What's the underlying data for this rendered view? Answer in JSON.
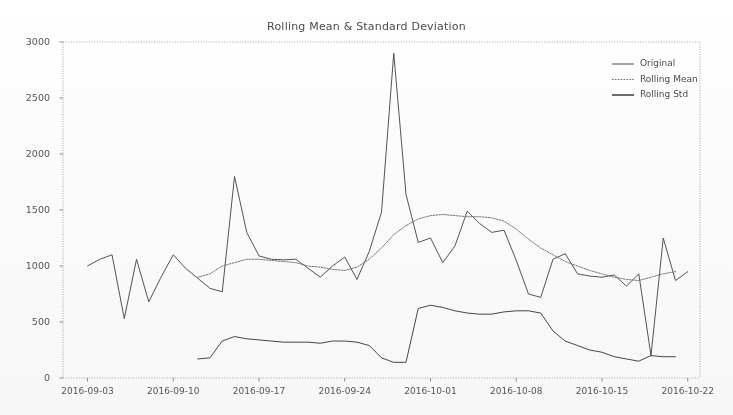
{
  "chart_data": {
    "type": "line",
    "title": "Rolling Mean & Standard Deviation",
    "xlabel": "",
    "ylabel": "",
    "ylim": [
      0,
      3000
    ],
    "yticks": [
      0,
      500,
      1000,
      1500,
      2000,
      2500,
      3000
    ],
    "ytick_labels": [
      "0",
      "500",
      "1000",
      "1500",
      "2000",
      "2500",
      "3000"
    ],
    "xticks": [
      "2016-09-03",
      "2016-09-10",
      "2016-09-17",
      "2016-09-24",
      "2016-10-01",
      "2016-10-08",
      "2016-10-15",
      "2016-10-22"
    ],
    "xtick_positions": [
      0.0385,
      0.1731,
      0.3077,
      0.4423,
      0.5769,
      0.7115,
      0.8462,
      0.9808
    ],
    "grid": false,
    "legend_position": "upper right",
    "legend": [
      {
        "name": "Original",
        "color": "#4a4a4a",
        "style": "solid"
      },
      {
        "name": "Rolling Mean",
        "color": "#6e6e6e",
        "style": "dotted"
      },
      {
        "name": "Rolling Std",
        "color": "#3c3c3c",
        "style": "solid"
      }
    ],
    "series": [
      {
        "name": "Original",
        "color": "#4a4a4a",
        "x_start": 0.0385,
        "x_step": 0.01923,
        "values": [
          1000,
          1060,
          1100,
          530,
          1060,
          680,
          900,
          1100,
          980,
          890,
          800,
          770,
          1800,
          1300,
          1090,
          1060,
          1055,
          1060,
          980,
          900,
          1000,
          1080,
          880,
          1130,
          1480,
          2900,
          1640,
          1210,
          1250,
          1030,
          1180,
          1490,
          1380,
          1300,
          1320,
          1050,
          750,
          720,
          1060,
          1110,
          930,
          910,
          900,
          920,
          820,
          930,
          200,
          1250,
          870,
          950
        ]
      },
      {
        "name": "Rolling Mean",
        "color": "#6e6e6e",
        "x_start": 0.2115,
        "x_step": 0.01923,
        "values": [
          900,
          930,
          1000,
          1030,
          1060,
          1060,
          1050,
          1040,
          1030,
          1000,
          990,
          970,
          960,
          990,
          1060,
          1160,
          1280,
          1360,
          1420,
          1450,
          1460,
          1450,
          1440,
          1440,
          1430,
          1400,
          1330,
          1240,
          1160,
          1100,
          1040,
          1000,
          960,
          930,
          900,
          880,
          870,
          900,
          930,
          950
        ]
      },
      {
        "name": "Rolling Std",
        "color": "#3c3c3c",
        "x_start": 0.2115,
        "x_step": 0.01923,
        "values": [
          170,
          180,
          330,
          370,
          350,
          340,
          330,
          320,
          320,
          320,
          310,
          330,
          330,
          320,
          290,
          180,
          140,
          140,
          620,
          650,
          630,
          600,
          580,
          570,
          570,
          590,
          600,
          600,
          580,
          420,
          330,
          290,
          250,
          230,
          190,
          170,
          150,
          200,
          190,
          190
        ]
      }
    ]
  },
  "axes": {
    "frame_color": "#9a9a9a",
    "tick_color": "#8a8a8a"
  }
}
